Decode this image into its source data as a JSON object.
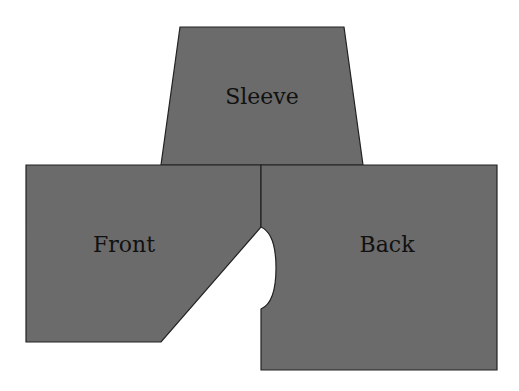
{
  "diagram": {
    "fill_color": "#6b6b6b",
    "stroke_color": "#222222",
    "background": "#ffffff",
    "pieces": [
      {
        "id": "sleeve",
        "label": "Sleeve"
      },
      {
        "id": "front",
        "label": "Front"
      },
      {
        "id": "back",
        "label": "Back"
      }
    ]
  }
}
